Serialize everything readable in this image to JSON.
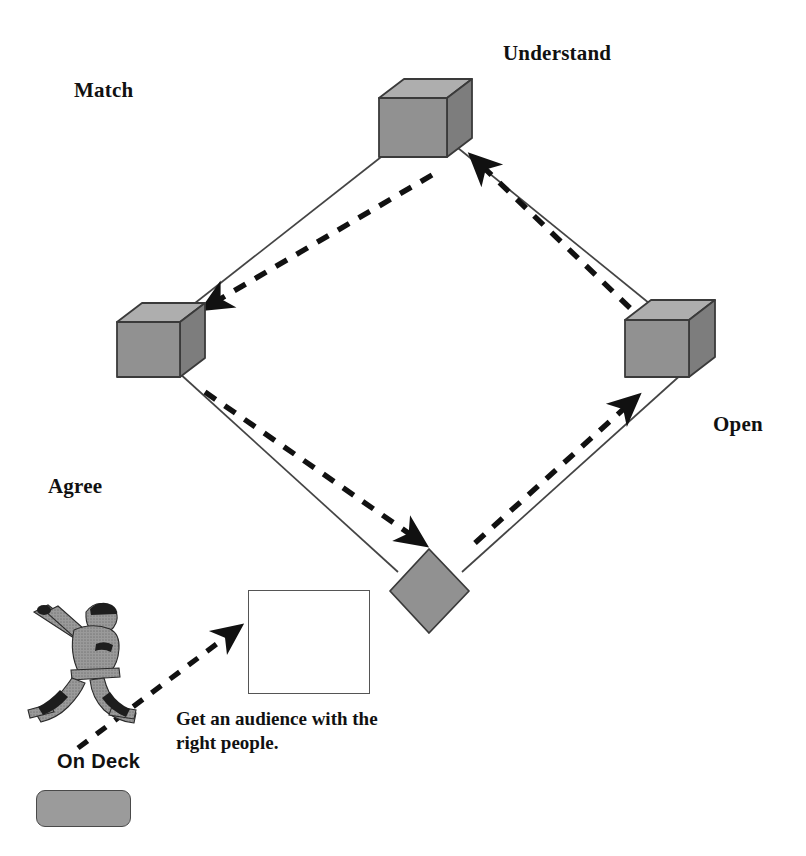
{
  "diagram": {
    "title_text_present": false,
    "nodes": [
      {
        "id": "match",
        "label": "Match",
        "label_x": 74,
        "label_y": 78,
        "shape": "cube",
        "cx": 155,
        "cy": 345
      },
      {
        "id": "understand",
        "label": "Understand",
        "label_x": 503,
        "label_y": 41,
        "shape": "cube",
        "cx": 420,
        "cy": 126
      },
      {
        "id": "open",
        "label": "Open",
        "label_x": 713,
        "label_y": 412,
        "shape": "cube",
        "cx": 663,
        "cy": 340
      },
      {
        "id": "agree",
        "label": "Agree",
        "label_x": 48,
        "label_y": 474,
        "shape": "diamond",
        "cx": 429,
        "cy": 590
      }
    ],
    "flow_arrows": [
      {
        "from": "understand",
        "to": "match",
        "style": "dashed"
      },
      {
        "from": "match",
        "to": "agree",
        "style": "dashed"
      },
      {
        "from": "agree",
        "to": "open",
        "style": "dashed"
      },
      {
        "from": "open",
        "to": "understand",
        "style": "dashed"
      }
    ],
    "callout": {
      "box_x": 248,
      "box_y": 590,
      "box_w": 122,
      "box_h": 104,
      "caption": "Get an audience with the right people.",
      "caption_x": 176,
      "caption_y": 707
    },
    "on_deck": {
      "label": "On Deck",
      "label_x": 57,
      "label_y": 750,
      "swatch_x": 36,
      "swatch_y": 790,
      "swatch_w": 95,
      "swatch_h": 37,
      "figure_name": "baseball-batter-clipart"
    },
    "colors": {
      "cube_front": "#8e8e8e",
      "cube_top": "#a9a9a9",
      "cube_side": "#7a7a7a",
      "cube_stroke": "#3a3a3a",
      "line": "#444444",
      "dash": "#111111",
      "swatch_fill": "#9b9b9b",
      "text": "#111111",
      "background": "#ffffff"
    }
  }
}
